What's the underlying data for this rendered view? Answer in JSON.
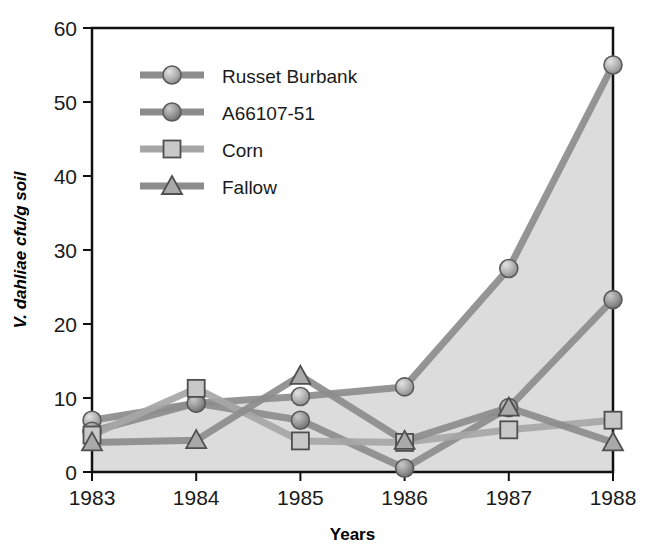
{
  "chart_data": {
    "type": "line",
    "title": "",
    "subtitle": "",
    "xlabel": "Years",
    "ylabel": "V. dahliae cfu/g soil",
    "categories": [
      "1983",
      "1984",
      "1985",
      "1986",
      "1987",
      "1988"
    ],
    "x": [
      1983,
      1984,
      1985,
      1986,
      1987,
      1988
    ],
    "xlim": [
      1983,
      1988
    ],
    "ylim": [
      0,
      60
    ],
    "yticks": [
      0,
      10,
      20,
      30,
      40,
      50,
      60
    ],
    "ytick_labels": [
      "0",
      "10",
      "20",
      "30",
      "40",
      "50",
      "60"
    ],
    "xtick_labels": [
      "1983",
      "1984",
      "1985",
      "1986",
      "1987",
      "1988"
    ],
    "grid": false,
    "legend_position": "upper-left-inside",
    "series": [
      {
        "name": "Russet Burbank",
        "marker": "circle",
        "color": "#8c8c8c",
        "marker_fill": "#b3b3b3",
        "values": [
          7.0,
          9.3,
          10.2,
          11.5,
          27.5,
          55.0
        ]
      },
      {
        "name": "A66107-51",
        "marker": "circle",
        "color": "#8c8c8c",
        "marker_fill": "#8f8f8f",
        "values": [
          5.5,
          9.3,
          7.0,
          0.5,
          8.7,
          23.3
        ]
      },
      {
        "name": "Corn",
        "marker": "square",
        "color": "#a6a6a6",
        "marker_fill": "#c4c4c4",
        "values": [
          5.0,
          11.3,
          4.2,
          4.0,
          5.7,
          7.0
        ]
      },
      {
        "name": "Fallow",
        "marker": "triangle",
        "color": "#8c8c8c",
        "marker_fill": "#9e9e9e",
        "values": [
          4.0,
          4.3,
          13.0,
          4.2,
          8.7,
          4.0
        ]
      }
    ]
  },
  "legend": {
    "items": [
      {
        "label": "Russet Burbank",
        "marker": "circle"
      },
      {
        "label": "A66107-51",
        "marker": "circle"
      },
      {
        "label": "Corn",
        "marker": "square"
      },
      {
        "label": "Fallow",
        "marker": "triangle"
      }
    ]
  },
  "colors": {
    "plot_fill": "#dcdcdc",
    "plot_background": "#ffffff",
    "axis": "#000000",
    "text": "#1a1a1a",
    "line_gray": "#8c8c8c",
    "line_light_gray": "#a6a6a6"
  }
}
